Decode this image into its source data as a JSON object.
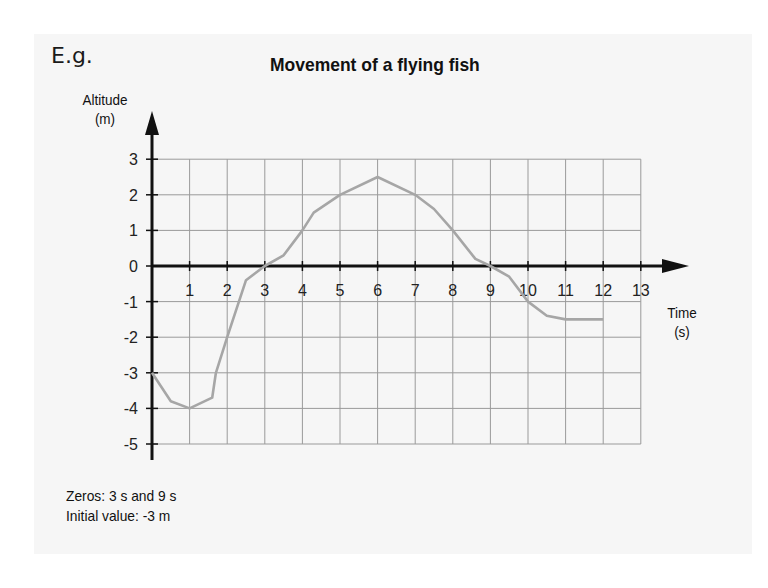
{
  "corner_label": "E.g.",
  "chart_data": {
    "type": "line",
    "title": "Movement of a flying fish",
    "xlabel": "Time\n(s)",
    "xlabel_lines": [
      "Time",
      "(s)"
    ],
    "ylabel": "Altitude\n(m)",
    "ylabel_lines": [
      "Altitude",
      "(m)"
    ],
    "xlim": [
      0,
      13
    ],
    "ylim": [
      -5,
      3
    ],
    "x_ticks": [
      1,
      2,
      3,
      4,
      5,
      6,
      7,
      8,
      9,
      10,
      11,
      12,
      13
    ],
    "y_ticks": [
      3,
      2,
      1,
      0,
      -1,
      -2,
      -3,
      -4,
      -5
    ],
    "grid": true,
    "legend": null,
    "series": [
      {
        "name": "Altitude",
        "color": "#a6a6a6",
        "x": [
          0,
          0.5,
          1,
          1.6,
          1.7,
          2,
          2.5,
          3,
          3.5,
          4,
          4.3,
          5,
          6,
          7,
          7.5,
          8,
          8.6,
          9,
          9.5,
          10,
          10.5,
          11,
          12
        ],
        "y": [
          -3,
          -3.8,
          -4,
          -3.7,
          -3,
          -2,
          -0.4,
          0,
          0.3,
          1,
          1.5,
          2,
          2.5,
          2,
          1.6,
          1,
          0.2,
          0,
          -0.3,
          -1,
          -1.4,
          -1.5,
          -1.5
        ]
      }
    ]
  },
  "notes": {
    "zeros": "Zeros: 3 s and 9 s",
    "initial_value": "Initial value: -3 m"
  },
  "colors": {
    "panel": "#f6f6f6",
    "grid": "#9a9a9a",
    "axis": "#111111",
    "curve": "#a6a6a6"
  }
}
